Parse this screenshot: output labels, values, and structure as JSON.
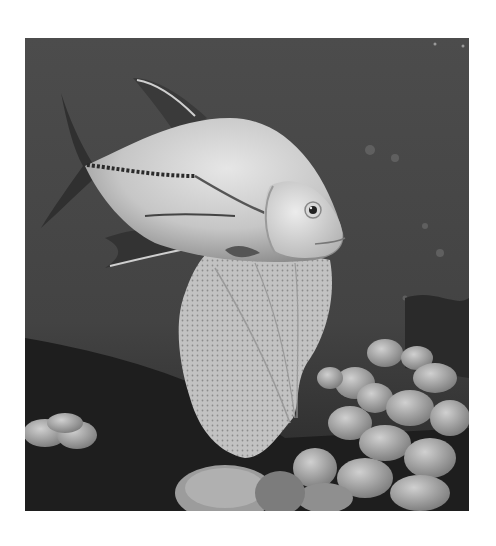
{
  "image": {
    "alt": "Grayscale underwater photograph of a jack fish swimming above a sea fan and coral reef",
    "subject": "jack fish",
    "elements": [
      "jack-fish",
      "sea-fan",
      "coral-reef",
      "dark-water-background"
    ],
    "colors": {
      "page_background": "#ffffff",
      "water": "#4a4a4a",
      "water_dark": "#2a2a2a",
      "fish_body": "#c8c8c8",
      "fish_highlight": "#e4e4e4",
      "fish_dark": "#303030",
      "sea_fan": "#bdbdbd",
      "coral_light": "#b8b8b8",
      "reef_dark": "#1c1c1c"
    }
  }
}
